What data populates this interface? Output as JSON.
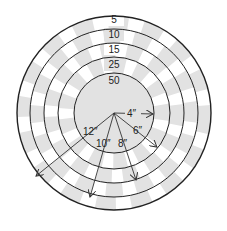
{
  "diagram": {
    "type": "target-rings",
    "center": {
      "x": 114,
      "y": 113
    },
    "colors": {
      "line": "#222222",
      "shade": "#e2e2e2",
      "background": "#ffffff",
      "arrow": "#333333"
    },
    "rings": [
      {
        "score": "5",
        "radius": 97
      },
      {
        "score": "10",
        "radius": 84
      },
      {
        "score": "15",
        "radius": 70
      },
      {
        "score": "25",
        "radius": 56
      },
      {
        "score": "50",
        "radius": 40
      }
    ],
    "ring_label_y": [
      21,
      36,
      50,
      64,
      80
    ],
    "radii_labels": [
      {
        "text": "4″",
        "x": 138,
        "y": 121
      },
      {
        "text": "6″",
        "x": 138,
        "y": 135
      },
      {
        "text": "8″",
        "x": 120,
        "y": 148
      },
      {
        "text": "10″",
        "x": 94,
        "y": 148
      },
      {
        "text": "12″",
        "x": 83,
        "y": 135
      }
    ]
  }
}
